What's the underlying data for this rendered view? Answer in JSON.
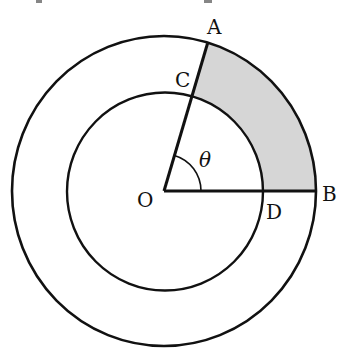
{
  "figure": {
    "type": "annulus-sector-diagram",
    "center": {
      "x": 164,
      "y": 191
    },
    "outer_radius": {
      "rx": 152,
      "ry": 155
    },
    "inner_radius": {
      "rx": 98,
      "ry": 99
    },
    "angle_deg": 73.5,
    "angle_arc_radius": 37,
    "stroke_color": "#111111",
    "shade_color": "#d6d6d6"
  },
  "labels": {
    "A": "A",
    "B": "B",
    "C": "C",
    "D": "D",
    "O": "O",
    "theta": "θ"
  },
  "points": {
    "A": {
      "x": 207,
      "y": 43
    },
    "B": {
      "x": 316,
      "y": 191
    },
    "C": {
      "x": 192,
      "y": 96
    },
    "D": {
      "x": 262,
      "y": 191
    },
    "O": {
      "x": 164,
      "y": 191
    }
  }
}
